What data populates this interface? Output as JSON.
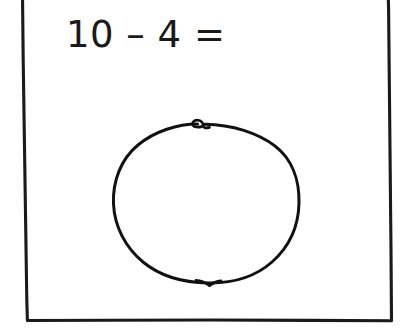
{
  "page": {
    "background_color": "#ffffff",
    "ink_color": "#1a1a1a",
    "width": 405,
    "height": 331
  },
  "border": {
    "name": "hand-drawn-rectangle-border",
    "stroke_color": "#1a1a1a",
    "stroke_width": 3
  },
  "equation": {
    "text": "10 – 4 =",
    "operand_left": "10",
    "operator": "–",
    "operand_right": "4",
    "equals": "=",
    "answer": "",
    "font_size_px": 37
  },
  "drawing": {
    "name": "hand-drawn-circle",
    "description": "large hand-drawn circle with a small loop at the top and a small notch at the bottom",
    "center_x": 206,
    "center_y": 204,
    "radius_x": 93,
    "radius_y": 80,
    "stroke_color": "#111111",
    "stroke_width": 3,
    "fill": "none"
  }
}
